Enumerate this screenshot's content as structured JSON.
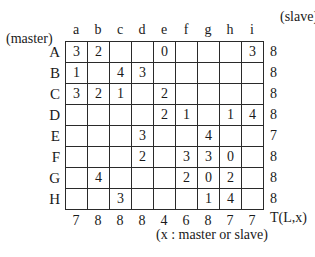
{
  "labels": {
    "master": "(master)",
    "slave": "(slave)",
    "total_label": "T(L,x)",
    "note": "(x : master or slave)"
  },
  "columns": [
    "a",
    "b",
    "c",
    "d",
    "e",
    "f",
    "g",
    "h",
    "i"
  ],
  "rows": [
    {
      "label": "A",
      "cells": [
        "3",
        "2",
        "",
        "",
        "0",
        "",
        "",
        "",
        "3"
      ],
      "total": "8"
    },
    {
      "label": "B",
      "cells": [
        "1",
        "",
        "4",
        "3",
        "",
        "",
        "",
        "",
        ""
      ],
      "total": "8"
    },
    {
      "label": "C",
      "cells": [
        "3",
        "2",
        "1",
        "",
        "2",
        "",
        "",
        "",
        ""
      ],
      "total": "8"
    },
    {
      "label": "D",
      "cells": [
        "",
        "",
        "",
        "",
        "2",
        "1",
        "",
        "1",
        "4"
      ],
      "total": "8"
    },
    {
      "label": "E",
      "cells": [
        "",
        "",
        "",
        "3",
        "",
        "",
        "4",
        "",
        ""
      ],
      "total": "7"
    },
    {
      "label": "F",
      "cells": [
        "",
        "",
        "",
        "2",
        "",
        "3",
        "3",
        "0",
        ""
      ],
      "total": "8"
    },
    {
      "label": "G",
      "cells": [
        "",
        "4",
        "",
        "",
        "",
        "2",
        "0",
        "2",
        ""
      ],
      "total": "8"
    },
    {
      "label": "H",
      "cells": [
        "",
        "",
        "3",
        "",
        "",
        "",
        "1",
        "4",
        ""
      ],
      "total": "8"
    }
  ],
  "column_totals": [
    "7",
    "8",
    "8",
    "8",
    "4",
    "6",
    "8",
    "7",
    "7"
  ]
}
